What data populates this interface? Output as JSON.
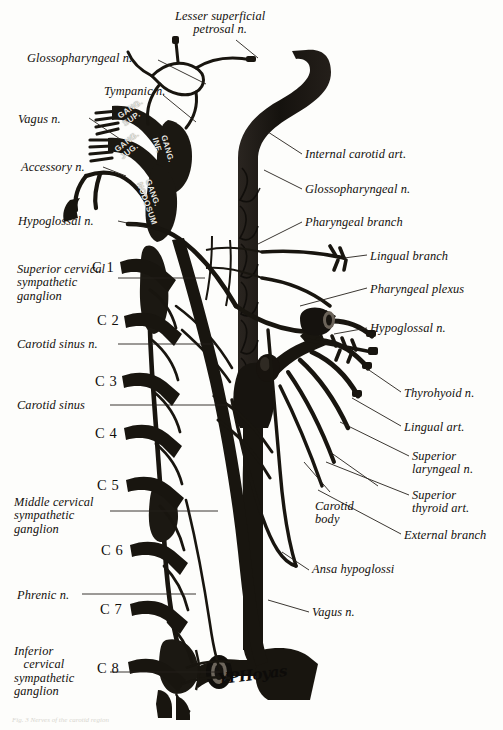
{
  "plate": {
    "title": "Carotid artery, cranial nerves and cervical sympathetic chain",
    "ink_color": "#1a1713",
    "paper_color": "#fdfdfb",
    "leader_color": "#2a2520",
    "signature": "YPHoyas"
  },
  "labels_left": [
    {
      "id": "glossopharyngeal-n",
      "text": "Glossopharyngeal n.",
      "x": 27,
      "y": 52
    },
    {
      "id": "tympanic-n",
      "text": "Tympanic n.",
      "x": 104,
      "y": 85
    },
    {
      "id": "vagus-n-upper",
      "text": "Vagus n.",
      "x": 18,
      "y": 113
    },
    {
      "id": "accessory-n",
      "text": "Accessory n.",
      "x": 21,
      "y": 161
    },
    {
      "id": "hypoglossal-n-left",
      "text": "Hypoglossal n.",
      "x": 18,
      "y": 215
    },
    {
      "id": "superior-cervical-sympathetic-ganglion",
      "text": "Superior cervical\nsympathetic\nganglion",
      "x": 17,
      "y": 263
    },
    {
      "id": "carotid-sinus-n",
      "text": "Carotid sinus n.",
      "x": 17,
      "y": 338
    },
    {
      "id": "carotid-sinus",
      "text": "Carotid sinus",
      "x": 17,
      "y": 399
    },
    {
      "id": "middle-cervical-sympathetic-ganglion",
      "text": "Middle cervical\nsympathetic\nganglion",
      "x": 14,
      "y": 496
    },
    {
      "id": "phrenic-n",
      "text": "Phrenic n.",
      "x": 17,
      "y": 589
    },
    {
      "id": "inferior-cervical-sympathetic-ganglion",
      "text": "Inferior\n   cervical\nsympathetic\nganglion",
      "x": 14,
      "y": 645
    }
  ],
  "label_top": {
    "id": "lesser-superficial-petrosal-n",
    "text": "Lesser superficial\npetrosal n.",
    "x": 175,
    "y": 10
  },
  "labels_right": [
    {
      "id": "internal-carotid-art",
      "text": "Internal carotid art.",
      "x": 305,
      "y": 148
    },
    {
      "id": "glossopharyngeal-n-right",
      "text": "Glossopharyngeal n.",
      "x": 305,
      "y": 183
    },
    {
      "id": "pharyngeal-branch",
      "text": "Pharyngeal branch",
      "x": 305,
      "y": 216
    },
    {
      "id": "lingual-branch",
      "text": "Lingual branch",
      "x": 370,
      "y": 250
    },
    {
      "id": "pharyngeal-plexus",
      "text": "Pharyngeal plexus",
      "x": 370,
      "y": 283
    },
    {
      "id": "hypoglossal-n-right",
      "text": "Hypoglossal n.",
      "x": 370,
      "y": 322
    },
    {
      "id": "thyrohyoid-n",
      "text": "Thyrohyoid n.",
      "x": 404,
      "y": 387
    },
    {
      "id": "lingual-art",
      "text": "Lingual art.",
      "x": 404,
      "y": 421
    },
    {
      "id": "superior-laryngeal-n",
      "text": "Superior\nlaryngeal n.",
      "x": 412,
      "y": 450
    },
    {
      "id": "superior-thyroid-art",
      "text": "Superior\nthyroid art.",
      "x": 412,
      "y": 489
    },
    {
      "id": "external-branch",
      "text": "External branch",
      "x": 404,
      "y": 529
    },
    {
      "id": "carotid-body",
      "text": "Carotid\nbody",
      "x": 315,
      "y": 500
    },
    {
      "id": "ansa-hypoglossi",
      "text": "Ansa hypoglossi",
      "x": 312,
      "y": 563
    },
    {
      "id": "vagus-n-lower",
      "text": "Vagus n.",
      "x": 312,
      "y": 606
    }
  ],
  "cervical_levels": [
    {
      "id": "c1",
      "text": "C 1",
      "x": 92,
      "y": 259
    },
    {
      "id": "c2",
      "text": "C 2",
      "x": 97,
      "y": 312
    },
    {
      "id": "c3",
      "text": "C 3",
      "x": 95,
      "y": 373
    },
    {
      "id": "c4",
      "text": "C 4",
      "x": 95,
      "y": 425
    },
    {
      "id": "c5",
      "text": "C 5",
      "x": 97,
      "y": 477
    },
    {
      "id": "c6",
      "text": "C 6",
      "x": 101,
      "y": 542
    },
    {
      "id": "c7",
      "text": "C 7",
      "x": 100,
      "y": 601
    },
    {
      "id": "c8",
      "text": "C 8",
      "x": 97,
      "y": 660
    }
  ],
  "ganglion_inscriptions": [
    {
      "id": "gang-sup",
      "line1": "GANG.",
      "line2": "SUP.",
      "x": 116,
      "y": 113,
      "rotate": -34
    },
    {
      "id": "gang-jug",
      "line1": "GANG.",
      "line2": "JUG.",
      "x": 113,
      "y": 147,
      "rotate": -38
    },
    {
      "id": "gang-inf",
      "line1": "GANG.",
      "line2": "INF.",
      "x": 168,
      "y": 134,
      "rotate": 74
    },
    {
      "id": "gang-nodosum",
      "line1": "GANG.",
      "line2": "NODOSUM",
      "x": 152,
      "y": 178,
      "rotate": 70
    }
  ],
  "bottom_caption": "Fig. 3 Nerves of the carotid region"
}
